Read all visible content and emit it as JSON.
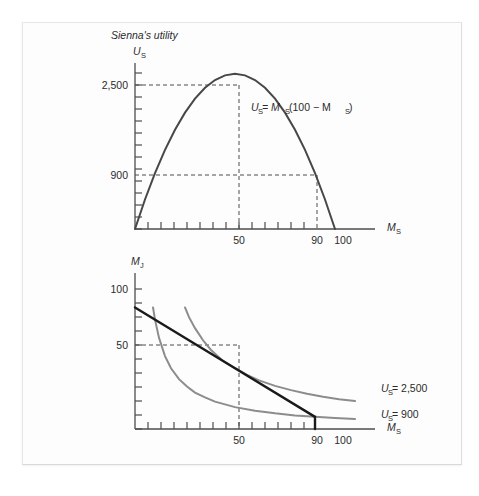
{
  "figure": {
    "title": "Sienna's utility",
    "panels": [
      {
        "id": "utility-curve-panel",
        "y_axis_label": "U",
        "y_axis_sub": "S",
        "x_axis_label": "M",
        "x_axis_sub": "S",
        "y_ticks_labeled": [
          "2,500",
          "900"
        ],
        "x_ticks_labeled": [
          "50",
          "90",
          "100"
        ],
        "curve_label": "U",
        "curve_label_sub": "S",
        "curve_equation": " = M",
        "curve_equation_sub": "S",
        "curve_equation_tail": "(100 − M",
        "curve_equation_sub2": "S",
        "curve_equation_end": ")"
      },
      {
        "id": "indifference-curve-panel",
        "y_axis_label": "M",
        "y_axis_sub": "J",
        "x_axis_label": "M",
        "x_axis_sub": "S",
        "y_ticks_labeled": [
          "100",
          "50"
        ],
        "x_ticks_labeled": [
          "50",
          "90",
          "100"
        ],
        "legend": [
          {
            "label": "U",
            "sub": "S",
            "value": " = 2,500"
          },
          {
            "label": "U",
            "sub": "S",
            "value": " = 900"
          }
        ]
      }
    ],
    "colors": {
      "curve_dark": "#474747",
      "curve_gray": "#8c8c8c",
      "budget_line": "#1a1a1a",
      "axis": "#4d4d4d",
      "card_background": "#fdfdfd",
      "page_background": "#ffffff"
    }
  },
  "chart_data": [
    {
      "type": "line",
      "id": "utility-parabola",
      "title": "Sienna's utility",
      "xlabel": "M_S",
      "ylabel": "U_S",
      "xlim": [
        0,
        120
      ],
      "ylim": [
        0,
        2900
      ],
      "grid": false,
      "equation": "U_S = M_S(100 - M_S)",
      "x_ticks": [
        0,
        10,
        20,
        30,
        40,
        50,
        60,
        70,
        80,
        90,
        100,
        110
      ],
      "x_tick_labels": {
        "50": "50",
        "90": "90",
        "100": "100"
      },
      "y_tick_labels": {
        "2500": "2,500",
        "900": "900"
      },
      "annotations": [
        {
          "text": "U_S = M_S(100 - M_S)",
          "x": 72,
          "y": 2050
        },
        {
          "text": "dashed guide at U=2,500, M=50",
          "x": 50,
          "y": 2500
        },
        {
          "text": "dashed guide at U=900, M=90",
          "x": 90,
          "y": 900
        }
      ],
      "series": [
        {
          "name": "U_S = M_S(100 - M_S)",
          "color": "#474747",
          "x": [
            0,
            5,
            10,
            15,
            20,
            25,
            30,
            35,
            40,
            45,
            50,
            55,
            60,
            65,
            70,
            75,
            80,
            85,
            90,
            95,
            100
          ],
          "y": [
            0,
            475,
            900,
            1275,
            1600,
            1875,
            2100,
            2275,
            2400,
            2475,
            2500,
            2475,
            2400,
            2275,
            2100,
            1875,
            1600,
            1275,
            900,
            475,
            0
          ]
        }
      ]
    },
    {
      "type": "line",
      "id": "indifference-map",
      "title": "",
      "xlabel": "M_S",
      "ylabel": "M_J",
      "xlim": [
        0,
        120
      ],
      "ylim": [
        0,
        130
      ],
      "grid": false,
      "x_ticks": [
        0,
        10,
        20,
        30,
        40,
        50,
        60,
        70,
        80,
        90,
        100,
        110
      ],
      "x_tick_labels": {
        "50": "50",
        "90": "90",
        "100": "100"
      },
      "y_tick_labels": {
        "100": "100",
        "50": "50"
      },
      "annotations": [
        {
          "text": "U_S = 2,500",
          "x": 112,
          "y": 22
        },
        {
          "text": "U_S = 900",
          "x": 112,
          "y": 10
        },
        {
          "text": "dashed guide at M_J=50, M_S=50",
          "x": 50,
          "y": 50
        }
      ],
      "series": [
        {
          "name": "U_S = 900",
          "color": "#8c8c8c",
          "x": [
            9,
            10,
            12,
            15,
            18,
            22,
            26,
            30,
            35,
            40,
            50,
            60,
            70,
            80,
            90,
            100,
            110
          ],
          "y": [
            100,
            90,
            75,
            60,
            50,
            41,
            35,
            30,
            26,
            22.5,
            18,
            15,
            12.9,
            11.2,
            10,
            9,
            8.2
          ]
        },
        {
          "name": "U_S = 2,500",
          "color": "#8c8c8c",
          "x": [
            25,
            27,
            30,
            34,
            38,
            44,
            50,
            56,
            62,
            70,
            78,
            86,
            94,
            102,
            110
          ],
          "y": [
            100,
            92,
            83,
            73,
            65,
            56,
            50,
            44.5,
            40,
            35.5,
            32,
            29,
            26.5,
            24.5,
            23
          ]
        },
        {
          "name": "budget line",
          "color": "#1a1a1a",
          "x": [
            0,
            50,
            90
          ],
          "y": [
            100,
            50,
            10
          ]
        }
      ]
    }
  ]
}
